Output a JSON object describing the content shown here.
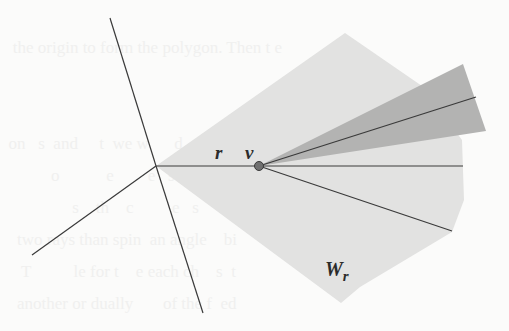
{
  "figure": {
    "labels": {
      "ray": "r",
      "vertex": "v",
      "region": "W",
      "region_subscript": "r"
    },
    "colors": {
      "background": "#fbfbfa",
      "light_region": "#e2e2e1",
      "dark_wedge": "#b3b3b2",
      "line": "#3a3a3a",
      "vertex_dot": "#707070"
    }
  },
  "bleed_through_text": [
    "",
    "   the origin to form the polygon. Then t e",
    "                               ",
    "",
    "  on   s  and     t  we w      d   ss",
    "            o           e        e   s   a",
    "                 s    th    c         e   s     d",
    "    two rays than spin  an angle    bi",
    "     T          le for t    e each ch    s  t",
    "    another or dually       of the f  ed"
  ]
}
